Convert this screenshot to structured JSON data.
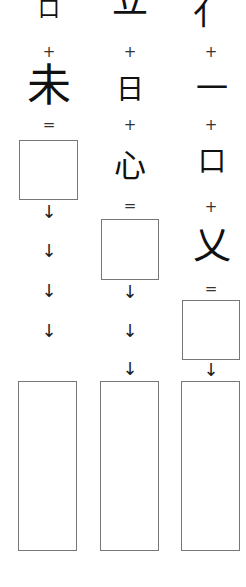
{
  "worksheet": {
    "columns": [
      {
        "parts": [
          "口",
          "未"
        ],
        "operators": [
          "+",
          "="
        ],
        "arrows": [
          "↓",
          "↓",
          "↓",
          "↓"
        ]
      },
      {
        "parts": [
          "立",
          "日",
          "心"
        ],
        "operators": [
          "+",
          "+",
          "="
        ],
        "arrows": [
          "↓",
          "↓",
          "↓"
        ]
      },
      {
        "parts": [
          "亻",
          "一",
          "口",
          "乂"
        ],
        "operators": [
          "+",
          "+",
          "+",
          "="
        ],
        "arrows": [
          "↓"
        ]
      }
    ]
  }
}
